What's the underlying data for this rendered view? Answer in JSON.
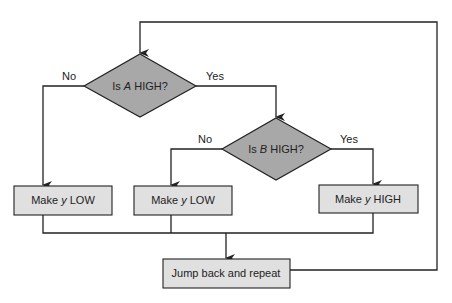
{
  "diagram": {
    "type": "flowchart",
    "colors": {
      "decision_fill": "#a8a8a8",
      "process_fill": "#e0e0e0",
      "line": "#222222",
      "background": "#ffffff"
    },
    "nodes": [
      {
        "id": "decision_a",
        "shape": "diamond",
        "pre": "Is ",
        "var": "A",
        "post": " HIGH?"
      },
      {
        "id": "decision_b",
        "shape": "diamond",
        "pre": "Is ",
        "var": "B",
        "post": " HIGH?"
      },
      {
        "id": "process_low_1",
        "shape": "rect",
        "pre": "Make ",
        "var": "y",
        "post": " LOW"
      },
      {
        "id": "process_low_2",
        "shape": "rect",
        "pre": "Make ",
        "var": "y",
        "post": " LOW"
      },
      {
        "id": "process_high",
        "shape": "rect",
        "pre": "Make ",
        "var": "y",
        "post": " HIGH"
      },
      {
        "id": "jump_back",
        "shape": "rect",
        "pre": "Jump back and repeat",
        "var": "",
        "post": ""
      }
    ],
    "edges": [
      {
        "from": "decision_a",
        "to": "process_low_1",
        "label": "No"
      },
      {
        "from": "decision_a",
        "to": "decision_b",
        "label": "Yes"
      },
      {
        "from": "decision_b",
        "to": "process_low_2",
        "label": "No"
      },
      {
        "from": "decision_b",
        "to": "process_high",
        "label": "Yes"
      },
      {
        "from": "process_low_1",
        "to": "jump_back",
        "label": ""
      },
      {
        "from": "process_low_2",
        "to": "jump_back",
        "label": ""
      },
      {
        "from": "process_high",
        "to": "jump_back",
        "label": ""
      },
      {
        "from": "jump_back",
        "to": "decision_a",
        "label": ""
      }
    ]
  }
}
